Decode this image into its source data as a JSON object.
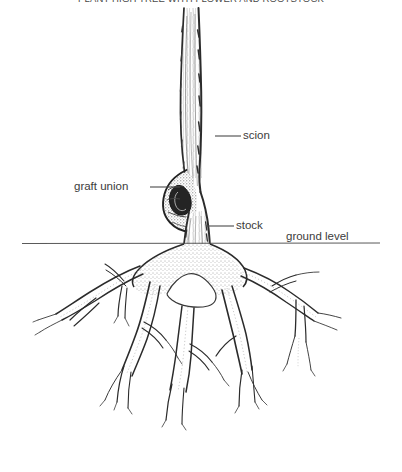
{
  "figure": {
    "title": "PLANT HIGH TREE WITH FLOWER AND ROOTSTOCK",
    "background_color": "#ffffff",
    "ink_color": "#2b2b2b",
    "label_color": "#3c3c3c"
  },
  "labels": {
    "scion": "scion",
    "graft_union": "graft union",
    "stock": "stock",
    "ground_level": "ground level"
  },
  "diagram_parts": {
    "trunk": "scion-trunk",
    "union": "graft-union-bulge",
    "stock": "stock-trunk",
    "ground_line": "ground-level-line",
    "roots": "rootstock-root-system"
  }
}
